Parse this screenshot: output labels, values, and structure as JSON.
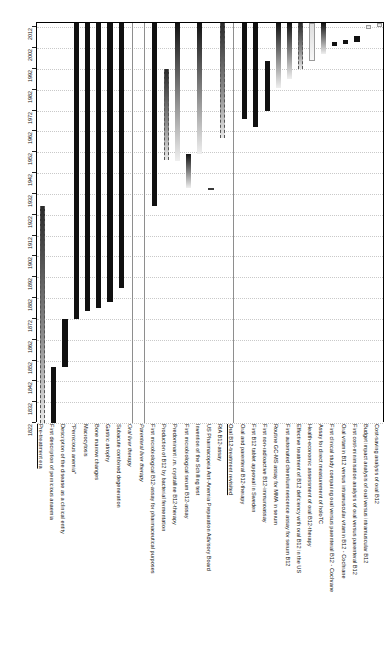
{
  "chart_data": {
    "type": "bar",
    "orientation": "vertical-timeline",
    "xlabel": "",
    "ylabel": "Year",
    "ylim": [
      1822,
      2014
    ],
    "grid": true,
    "legend": false,
    "axis_ticks": [
      "1822",
      "1832",
      "1842",
      "1852",
      "1862",
      "1872",
      "1882",
      "1892",
      "1902",
      "1912",
      "1922",
      "1932",
      "1942",
      "1952",
      "1962",
      "1972",
      "1982",
      "1992",
      "2002",
      "2012"
    ],
    "categories": [
      "Pre-treatment era",
      "First description of pernicious anaemia",
      "Description of the disease as a clinical entity",
      "\"Pernicious anemia\"",
      "Macrocytosis",
      "Bone marrow changes",
      "Gastric atrophy",
      "Subacute combined degeneration",
      "Oral liver therapy",
      "Parenteral liver therapy",
      "First microbiological B12-assay for pharmaceutical purposes",
      "Production of B12 by bacterial fermentation",
      "Predominant i.m. crystalline B12-therapy",
      "First microbiological serum B12-assay",
      "Invention of the Schilling test",
      "US Pharmacopeia Anti-Anemia Preparation Advisory Board",
      "RIA B12-assay",
      "Oral B12-treatment revisited",
      "Oral and parenteral B12-therapy",
      "First B12 tablet approval in Sweden",
      "First non-radioactive B12-immunoassay",
      "Routine GC-MS assay for MMA in serum",
      "First automated chemiluminescence assay for serum B12",
      "Effective treatment of B12 deficiency with oral B12 in the US",
      "Health-economic assessment of oral B12-therapy",
      "Assay for direct measurement of holoTC",
      "First clinical study comparing oral versus parenteral B12 - Cochrane",
      "Oral vitamin B12 versus intramuscular vitamin B12 - Cochrane",
      "First cost-minimisation analysis of oral versus parenteral B12",
      "Budget impact analysis of oral versus intramuscular B12",
      "Cost-saving analysis of oral B12"
    ],
    "bars": [
      {
        "label": "Pre-treatment era",
        "start": 1822,
        "end": 1926,
        "style": "dash",
        "header": true
      },
      {
        "label": "First description of pernicious anaemia",
        "start": 1822,
        "end": 1849,
        "style": "solid"
      },
      {
        "label": "Description of the disease as a clinical entity",
        "start": 1849,
        "end": 1872,
        "style": "solid"
      },
      {
        "label": "\"Pernicious anemia\"",
        "start": 1872,
        "end": 2014,
        "style": "solid"
      },
      {
        "label": "Macrocytosis",
        "start": 1876,
        "end": 2014,
        "style": "solid"
      },
      {
        "label": "Bone marrow changes",
        "start": 1877,
        "end": 2014,
        "style": "solid"
      },
      {
        "label": "Gastric atrophy",
        "start": 1880,
        "end": 2014,
        "style": "solid"
      },
      {
        "label": "Subacute combined degeneration",
        "start": 1887,
        "end": 2014,
        "style": "solid"
      },
      {
        "label": "Oral liver therapy",
        "start": 1926,
        "end": 1926,
        "style": "separator"
      },
      {
        "label": "Parenteral liver therapy",
        "start": 1926,
        "end": 1926,
        "style": "separator"
      },
      {
        "label": "First microbiological B12-assay for pharmaceutical purposes",
        "start": 1926,
        "end": 2014,
        "style": "solid"
      },
      {
        "label": "Production of B12 by bacterial fermentation",
        "start": 1948,
        "end": 1992,
        "style": "dash"
      },
      {
        "label": "Predominant i.m. crystalline B12-therapy",
        "start": 1948,
        "end": 2014,
        "style": "grad"
      },
      {
        "label": "First microbiological serum B12-assay",
        "start": 1935,
        "end": 1951,
        "style": "grad"
      },
      {
        "label": "Invention of the Schilling test",
        "start": 1951,
        "end": 2014,
        "style": "grad"
      },
      {
        "label": "US Pharmacopeia Anti-Anemia Preparation Advisory Board",
        "start": 1934,
        "end": 1935,
        "style": "hollow"
      },
      {
        "label": "RIA B12-assay",
        "start": 1959,
        "end": 2014,
        "style": "dash"
      },
      {
        "label": "Oral B12-treatment revisited",
        "start": 1959,
        "end": 2014,
        "style": "separator",
        "header": true
      },
      {
        "label": "Oral and parenteral B12-therapy",
        "start": 1968,
        "end": 2014,
        "style": "solid"
      },
      {
        "label": "First B12 tablet approval in Sweden",
        "start": 1964,
        "end": 2014,
        "style": "solid"
      },
      {
        "label": "First non-radioactive B12-immunoassay",
        "start": 1972,
        "end": 1996,
        "style": "solid"
      },
      {
        "label": "Routine GC-MS assay for MMA in serum",
        "start": 1983,
        "end": 2014,
        "style": "grad"
      },
      {
        "label": "First automated chemiluminescence assay for serum B12",
        "start": 1987,
        "end": 2014,
        "style": "grad"
      },
      {
        "label": "Effective treatment of B12 deficiency with oral B12 in the US",
        "start": 1992,
        "end": 2014,
        "style": "dash"
      },
      {
        "label": "Health-economic assessment of oral B12-therapy",
        "start": 1996,
        "end": 2014,
        "style": "light"
      },
      {
        "label": "Assay for direct measurement of holoTC",
        "start": 1999,
        "end": 2014,
        "style": "grad"
      },
      {
        "label": "First clinical study comparing oral versus parenteral B12 - Cochrane",
        "start": 2003,
        "end": 2005,
        "style": "tiny"
      },
      {
        "label": "Oral vitamin B12 versus intramuscular vitamin B12 - Cochrane",
        "start": 2004,
        "end": 2006,
        "style": "tiny"
      },
      {
        "label": "First cost-minimisation analysis of oral versus parenteral B12",
        "start": 2005,
        "end": 2008,
        "style": "tiny"
      },
      {
        "label": "Budget impact analysis of oral versus intramuscular B12",
        "start": 2011,
        "end": 2013,
        "style": "light"
      },
      {
        "label": "Cost-saving analysis of oral B12",
        "start": 2012,
        "end": 2014,
        "style": "light"
      }
    ]
  },
  "axis": {
    "year_labels": [
      "2012",
      "2002",
      "1992",
      "1982",
      "1972",
      "1962",
      "1952",
      "1942",
      "1932",
      "1922",
      "1912",
      "1902",
      "1892",
      "1882",
      "1872",
      "1862",
      "1852",
      "1842",
      "1832",
      "1822"
    ]
  }
}
